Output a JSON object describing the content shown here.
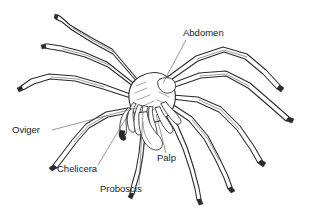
{
  "figure": {
    "background_color": "#ffffff",
    "line_color": "#2a2a2a",
    "leader_color": "#555555",
    "text_color": "#1a1a1a",
    "width": 317,
    "height": 216
  },
  "labels": [
    {
      "id": "abdomen",
      "text": "Abdomen",
      "text_x": 183,
      "text_y": 36,
      "anchor": "start",
      "leader": "M 186 40 L 163 83"
    },
    {
      "id": "oviger",
      "text": "Oviger",
      "text_x": 12,
      "text_y": 133,
      "anchor": "start",
      "leader": "M 52 130 L 136 108"
    },
    {
      "id": "chelicera",
      "text": "Chelicera",
      "text_x": 57,
      "text_y": 172,
      "anchor": "start",
      "leader": "M 98 165 L 129 113"
    },
    {
      "id": "proboscis",
      "text": "Proboscis",
      "text_x": 100,
      "text_y": 192,
      "anchor": "start",
      "leader": "M 139 185 L 143 112"
    },
    {
      "id": "palp",
      "text": "Palp",
      "text_x": 157,
      "text_y": 161,
      "anchor": "start",
      "leader": "M 166 153 L 156 114"
    }
  ]
}
